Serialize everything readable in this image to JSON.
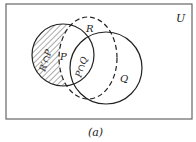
{
  "diagram": {
    "universe_label": "U",
    "caption": "(a)",
    "sets": [
      {
        "name": "P",
        "label": "P",
        "style": "solid"
      },
      {
        "name": "Q",
        "label": "Q",
        "style": "solid"
      },
      {
        "name": "R",
        "label": "R",
        "style": "dashed"
      }
    ],
    "region_labels": {
      "shaded": "R′∩P",
      "p_only": "P",
      "intersection": "P∩Q"
    },
    "colors": {
      "stroke": "#222222",
      "hatch": "#555555",
      "frame": "#666666"
    }
  }
}
